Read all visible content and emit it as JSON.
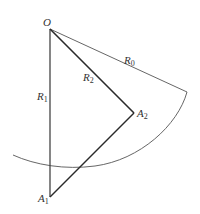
{
  "diagram": {
    "points": {
      "O": {
        "label": "O",
        "x": 50,
        "y": 29
      },
      "A1": {
        "label": "A",
        "sub": "1",
        "x": 50,
        "y": 197
      },
      "A2": {
        "label": "A",
        "sub": "2",
        "x": 134,
        "y": 113
      },
      "R0_end": {
        "x": 187,
        "y": 92
      }
    },
    "segments": [
      {
        "name": "R1",
        "label": "R",
        "sub": "1",
        "from": "O",
        "to": "A1"
      },
      {
        "name": "R2",
        "label": "R",
        "sub": "2",
        "from": "O",
        "to": "A2"
      },
      {
        "name": "R0",
        "label": "R",
        "sub": "0",
        "from": "O",
        "to": "R0_end"
      },
      {
        "name": "A1A2",
        "from": "A1",
        "to": "A2"
      }
    ],
    "arc": {
      "center": "O",
      "radius_label": "R0",
      "from": "R0_end",
      "to_x": 13,
      "to_y": 155
    },
    "labels": {
      "O": "O",
      "R0": "R",
      "R0_sub": "0",
      "R1": "R",
      "R1_sub": "1",
      "R2": "R",
      "R2_sub": "2",
      "A1": "A",
      "A1_sub": "1",
      "A2": "A",
      "A2_sub": "2"
    },
    "colors": {
      "line": "#2a2a2a",
      "thin_line": "#555555",
      "text": "#333333"
    }
  }
}
